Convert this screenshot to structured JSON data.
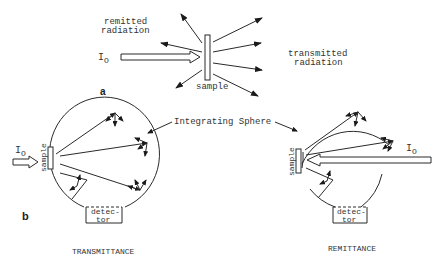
{
  "panel_a": {
    "label": "a",
    "incident": "I",
    "incident_sub": "O",
    "sample_label": "sample",
    "remitted_line1": "remitted",
    "remitted_line2": "radiation",
    "transmitted_line1": "transmitted",
    "transmitted_line2": "radiation"
  },
  "panel_b": {
    "label": "b",
    "integrating_sphere_label": "Integrating Sphere",
    "left": {
      "incident": "I",
      "incident_sub": "O",
      "sample_label": "sample",
      "detector_line1": "detec-",
      "detector_line2": "tor",
      "caption": "TRANSMITTANCE"
    },
    "right": {
      "incident": "I",
      "incident_sub": "O",
      "sample_label": "sample",
      "detector_line1": "detec-",
      "detector_line2": "tor",
      "caption": "REMITTANCE"
    }
  },
  "colors": {
    "ink": "#2a2a2a",
    "background": "#ffffff"
  }
}
